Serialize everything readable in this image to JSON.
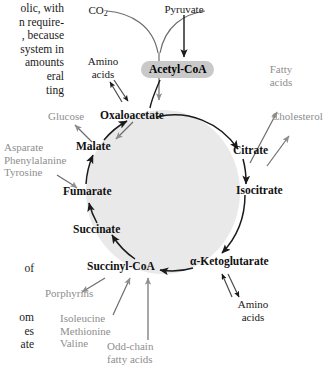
{
  "figure": {
    "cycle_fill_color": "#e9e9e9",
    "cycle_stroke_color": "#1a1a1a",
    "primary_label_color": "#111111",
    "secondary_label_color": "#8e8e8e",
    "acetyl_coa_pill_color": "#c9c9c9",
    "arrow_color_primary": "#1a1a1a",
    "arrow_color_secondary": "#8e8e8e"
  },
  "body_text": {
    "top_block": "olic, with\nn require-\n, because\nsystem in\n amounts\neral\nting",
    "middle_block": "of",
    "bottom_block": "om\nes\nate"
  },
  "cycle_intermediates": [
    {
      "id": "oxaloacetate",
      "label": "Oxaloacetate"
    },
    {
      "id": "citrate",
      "label": "Citrate"
    },
    {
      "id": "isocitrate",
      "label": "Isocitrate"
    },
    {
      "id": "alpha-ketoglutarate",
      "label": "α-Ketoglutarate"
    },
    {
      "id": "succinyl-coa",
      "label": "Succinyl-CoA"
    },
    {
      "id": "succinate",
      "label": "Succinate"
    },
    {
      "id": "fumarate",
      "label": "Fumarate"
    },
    {
      "id": "malate",
      "label": "Malate"
    }
  ],
  "hub": {
    "acetyl_coa": "Acetyl-CoA",
    "pyruvate": "Pyruvate",
    "co2": "CO",
    "co2_subscript": "2"
  },
  "inputs_outputs": [
    {
      "id": "amino-acids-top",
      "label": "Amino\nacids",
      "style": "dark",
      "direction": "bidirectional",
      "connects": "oxaloacetate"
    },
    {
      "id": "glucose",
      "label": "Glucose",
      "style": "gray",
      "direction": "out",
      "connects": "malate"
    },
    {
      "id": "asparate-group",
      "label": "Asparate\nPhenylalanine\nTyrosine",
      "style": "gray",
      "direction": "in",
      "connects": "fumarate"
    },
    {
      "id": "fatty-acids",
      "label": "Fatty\nacids",
      "style": "gray",
      "direction": "out",
      "connects": "citrate"
    },
    {
      "id": "cholesterol",
      "label": "Cholesterol",
      "style": "gray",
      "direction": "out",
      "connects": "citrate"
    },
    {
      "id": "amino-acids-bottom",
      "label": "Amino\nacids",
      "style": "dark",
      "direction": "bidirectional",
      "connects": "alpha-ketoglutarate"
    },
    {
      "id": "porphyrins",
      "label": "Porphyrins",
      "style": "gray",
      "direction": "out",
      "connects": "succinyl-coa"
    },
    {
      "id": "ile-met-val",
      "label": "Isoleucine\nMethionine\nValine",
      "style": "gray",
      "direction": "in",
      "connects": "succinyl-coa"
    },
    {
      "id": "odd-chain-fa",
      "label": "Odd-chain\nfatty acids",
      "style": "gray",
      "direction": "in",
      "connects": "succinyl-coa"
    }
  ]
}
